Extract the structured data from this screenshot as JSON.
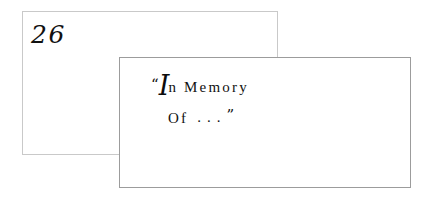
{
  "page": {
    "background_color": "#ffffff",
    "width": 427,
    "height": 200
  },
  "page_number": {
    "value": "26"
  },
  "frames": {
    "back": {
      "border_color": "#c9c9c9",
      "label": "back-rectangle"
    },
    "front": {
      "border_color": "#9c9c9c",
      "label": "front-rectangle"
    }
  },
  "caption": {
    "full_text": "“In Memory Of . . .”",
    "quote_open": "“",
    "swash_initial": "I",
    "line1_rest": "n",
    "line1_word2": "Memory",
    "line2_word": "Of",
    "ellipsis": "...",
    "quote_close": "”",
    "text_color": "#111111"
  }
}
